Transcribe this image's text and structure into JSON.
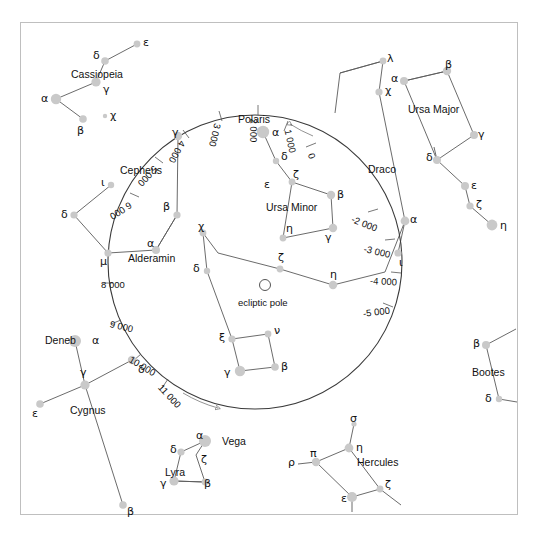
{
  "figure": {
    "frame_color": "#bfbfbf",
    "star_color": "#c9c9c9",
    "line_color": "#4a4a4a",
    "circle_color": "#3a3a3a",
    "background": "#ffffff"
  },
  "ecliptic_pole": {
    "label": "ecliptic pole",
    "marker": "open-circle"
  },
  "precession_circle": {
    "name": "precession-circle",
    "direction_markers": [
      "arrowhead-upper-right",
      "arrowhead-lower-left"
    ],
    "ticks": [
      {
        "label": "0",
        "value": 0
      },
      {
        "label": "1 000",
        "value": 1000
      },
      {
        "label": "2 000",
        "value": 2000
      },
      {
        "label": "3 000",
        "value": 3000
      },
      {
        "label": "4 000",
        "value": 4000
      },
      {
        "label": "5 000",
        "value": 5000
      },
      {
        "label": "6 000",
        "value": 6000
      },
      {
        "label": "8 000",
        "value": 8000
      },
      {
        "label": "9 000",
        "value": 9000
      },
      {
        "label": "10 000",
        "value": 10000
      },
      {
        "label": "11 000",
        "value": 11000
      },
      {
        "label": "-2 000",
        "value": -2000
      },
      {
        "label": "-3 000",
        "value": -3000
      },
      {
        "label": "-4 000",
        "value": -4000
      },
      {
        "label": "-5 000",
        "value": -5000
      }
    ]
  },
  "constellations": [
    {
      "name": "Cassiopeia",
      "stars": [
        "ε",
        "δ",
        "γ",
        "α",
        "β"
      ]
    },
    {
      "name": "Cepheus",
      "stars": [
        "ι",
        "δ",
        "μ",
        "α",
        "β",
        "γ"
      ]
    },
    {
      "name": "Ursa Minor",
      "stars": [
        "α",
        "δ",
        "ε",
        "ζ",
        "η",
        "γ",
        "β"
      ]
    },
    {
      "name": "Ursa Major",
      "stars": [
        "α",
        "β",
        "γ",
        "δ",
        "ε",
        "ζ",
        "η"
      ]
    },
    {
      "name": "Draco",
      "stars": [
        "λ",
        "χ",
        "α",
        "ι",
        "η",
        "ζ",
        "χ",
        "δ",
        "ξ",
        "ν",
        "β",
        "γ"
      ]
    },
    {
      "name": "Cygnus",
      "stars": [
        "α",
        "γ",
        "δ",
        "ε",
        "β"
      ]
    },
    {
      "name": "Lyra",
      "stars": [
        "α",
        "δ",
        "ζ",
        "γ",
        "β"
      ]
    },
    {
      "name": "Hercules",
      "stars": [
        "σ",
        "η",
        "π",
        "ρ",
        "ζ",
        "ε"
      ]
    },
    {
      "name": "Bootes",
      "stars": [
        "β",
        "δ"
      ]
    }
  ],
  "named_stars": [
    {
      "label": "Polaris",
      "constellation": "Ursa Minor"
    },
    {
      "label": "Alderamin",
      "constellation": "Cepheus"
    },
    {
      "label": "Deneb",
      "constellation": "Cygnus"
    },
    {
      "label": "Vega",
      "constellation": "Lyra"
    }
  ],
  "labels": {
    "cassiopeia": "Cassiopeia",
    "cepheus": "Cepheus",
    "ursa_minor": "Ursa Minor",
    "ursa_major": "Ursa Major",
    "draco": "Draco",
    "cygnus": "Cygnus",
    "lyra": "Lyra",
    "hercules": "Hercules",
    "bootes": "Bootes",
    "polaris": "Polaris",
    "alderamin": "Alderamin",
    "deneb": "Deneb",
    "vega": "Vega",
    "ecliptic_pole": "ecliptic pole"
  },
  "greek": {
    "alpha": "α",
    "beta": "β",
    "gamma": "γ",
    "delta": "δ",
    "epsilon": "ε",
    "zeta": "ζ",
    "eta": "η",
    "iota": "ι",
    "lambda": "λ",
    "mu": "μ",
    "nu": "ν",
    "xi": "ξ",
    "pi": "π",
    "rho": "ρ",
    "sigma": "σ",
    "chi": "χ"
  },
  "ticks": {
    "t0": "0",
    "t1000": "1 000",
    "t2000": "2 000",
    "t3000": "3 000",
    "t4000": "4 000",
    "t5000": "5 000",
    "t6000": "6 000",
    "t8000": "8 000",
    "t9000": "9 000",
    "t10000": "10 000",
    "t11000": "11 000",
    "tm2000": "-2 000",
    "tm3000": "-3 000",
    "tm4000": "-4 000",
    "tm5000": "-5 000"
  }
}
